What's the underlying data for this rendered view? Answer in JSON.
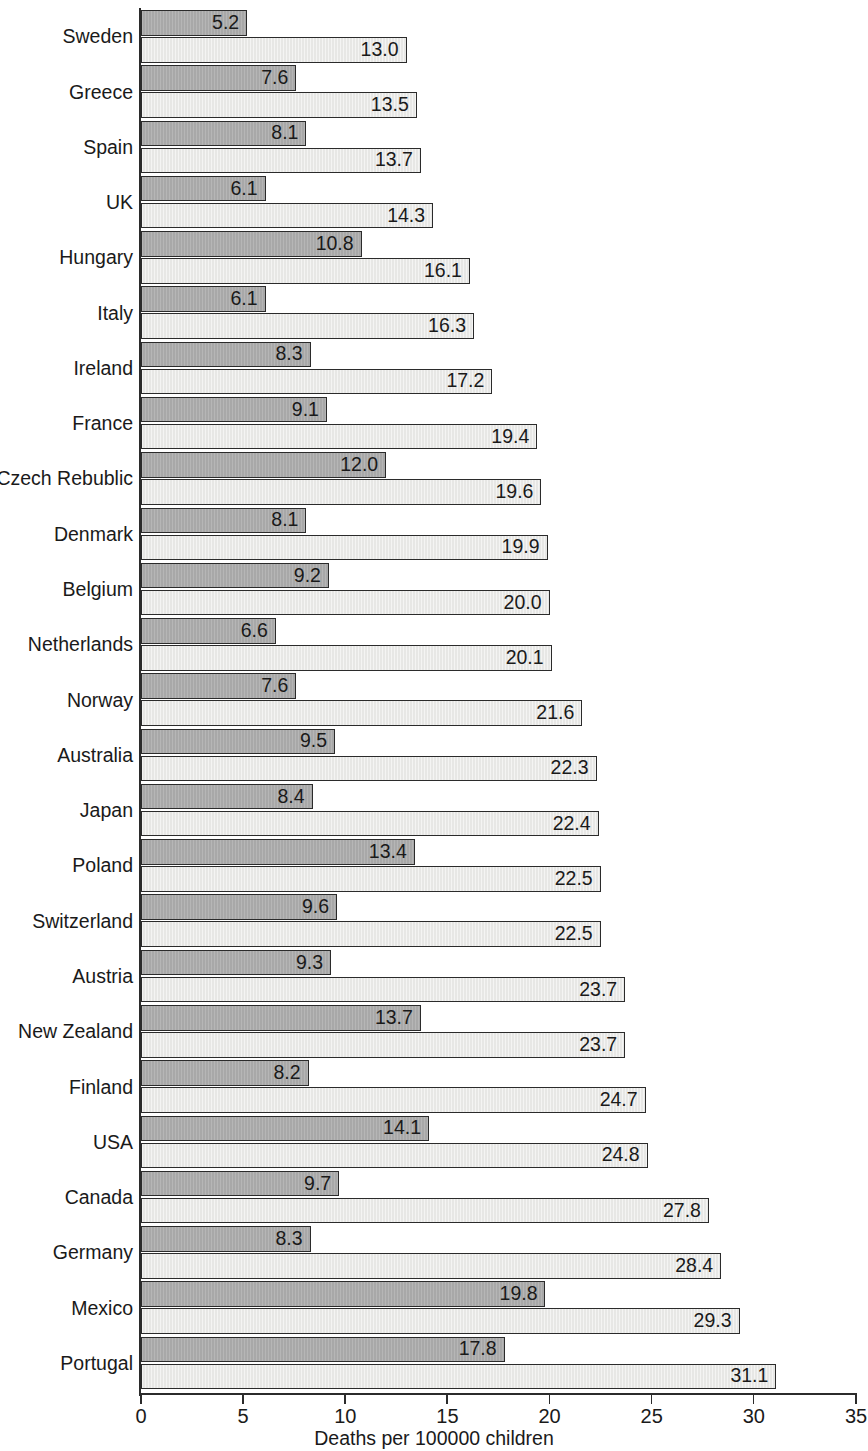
{
  "chart_data": {
    "type": "bar",
    "orientation": "horizontal",
    "title": "",
    "xlabel": "Deaths per 100000 children",
    "ylabel": "",
    "xlim": [
      0,
      35
    ],
    "xticks": [
      0,
      5,
      10,
      15,
      20,
      25,
      30,
      35
    ],
    "xtick_labels": [
      "0",
      "5",
      "10",
      "15",
      "20",
      "25",
      "30",
      "35"
    ],
    "grid": false,
    "legend": null,
    "categories": [
      "Sweden",
      "Greece",
      "Spain",
      "UK",
      "Hungary",
      "Italy",
      "Ireland",
      "France",
      "Czech Rebublic",
      "Denmark",
      "Belgium",
      "Netherlands",
      "Norway",
      "Australia",
      "Japan",
      "Poland",
      "Switzerland",
      "Austria",
      "New Zealand",
      "Finland",
      "USA",
      "Canada",
      "Germany",
      "Mexico",
      "Portugal"
    ],
    "series": [
      {
        "name": "primary",
        "color": "#a8a8a8",
        "values": [
          5.2,
          7.6,
          8.1,
          6.1,
          10.8,
          6.1,
          8.3,
          9.1,
          12.0,
          8.1,
          9.2,
          6.6,
          7.6,
          9.5,
          8.4,
          13.4,
          9.6,
          9.3,
          13.7,
          8.2,
          14.1,
          9.7,
          8.3,
          19.8,
          17.8
        ],
        "labels": [
          "5.2",
          "7.6",
          "8.1",
          "6.1",
          "10.8",
          "6.1",
          "8.3",
          "9.1",
          "12.0",
          "8.1",
          "9.2",
          "6.6",
          "7.6",
          "9.5",
          "8.4",
          "13.4",
          "9.6",
          "9.3",
          "13.7",
          "8.2",
          "14.1",
          "9.7",
          "8.3",
          "19.8",
          "17.8"
        ]
      },
      {
        "name": "secondary",
        "color": "#e7e7e5",
        "values": [
          13.0,
          13.5,
          13.7,
          14.3,
          16.1,
          16.3,
          17.2,
          19.4,
          19.6,
          19.9,
          20.0,
          20.1,
          21.6,
          22.3,
          22.4,
          22.5,
          22.5,
          23.7,
          23.7,
          24.7,
          24.8,
          27.8,
          28.4,
          29.3,
          31.1
        ],
        "labels": [
          "13.0",
          "13.5",
          "13.7",
          "14.3",
          "16.1",
          "16.3",
          "17.2",
          "19.4",
          "19.6",
          "19.9",
          "20.0",
          "20.1",
          "21.6",
          "22.3",
          "22.4",
          "22.5",
          "22.5",
          "23.7",
          "23.7",
          "24.7",
          "24.8",
          "27.8",
          "28.4",
          "29.3",
          "31.1"
        ]
      }
    ]
  }
}
